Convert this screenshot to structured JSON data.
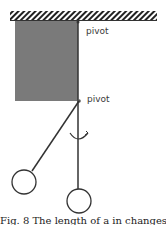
{
  "diagram": {
    "labels": {
      "pivot_top": "pivot",
      "pivot_bottom": "pivot"
    },
    "caption": "Fig. 8 The length of a in changes",
    "colors": {
      "block_fill": "#7a7a7a",
      "line": "#333333",
      "ceiling_hatch": "#222222",
      "background": "#ffffff"
    },
    "elements": [
      {
        "type": "ceiling",
        "hatched": true
      },
      {
        "type": "block",
        "shape": "rectangle",
        "fill": "gray"
      },
      {
        "type": "pivot",
        "label": "pivot",
        "position": "top"
      },
      {
        "type": "pivot",
        "label": "pivot",
        "position": "bottom"
      },
      {
        "type": "pendulum",
        "position": "displaced",
        "bob": "circle"
      },
      {
        "type": "pendulum",
        "position": "vertical",
        "bob": "circle"
      },
      {
        "type": "rotation-arrow"
      }
    ]
  }
}
